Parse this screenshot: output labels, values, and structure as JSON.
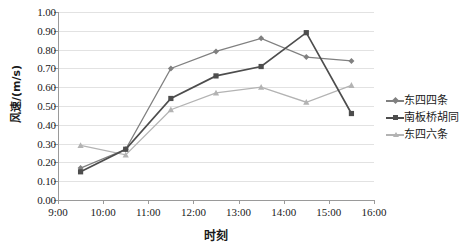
{
  "chart_data": {
    "type": "line",
    "title": "",
    "xlabel": "时刻",
    "ylabel": "风速/(m/s)",
    "ylim": [
      0.0,
      1.0
    ],
    "ytick_labels": [
      "0.00",
      "0.10",
      "0.20",
      "0.30",
      "0.40",
      "0.50",
      "0.60",
      "0.70",
      "0.80",
      "0.90",
      "1.00"
    ],
    "ytick_values": [
      0.0,
      0.1,
      0.2,
      0.3,
      0.4,
      0.5,
      0.6,
      0.7,
      0.8,
      0.9,
      1.0
    ],
    "xtick_labels": [
      "9:00",
      "10:00",
      "11:00",
      "12:00",
      "13:00",
      "14:00",
      "15:00",
      "16:00"
    ],
    "xtick_values": [
      9,
      10,
      11,
      12,
      13,
      14,
      15,
      16
    ],
    "xlim": [
      9,
      16
    ],
    "grid": "horizontal",
    "legend_position": "right",
    "x": [
      9.5,
      10.5,
      11.5,
      12.5,
      13.5,
      14.5,
      15.5
    ],
    "series": [
      {
        "name": "东四四条",
        "color": "#808080",
        "marker": "diamond",
        "values": [
          0.17,
          0.27,
          0.7,
          0.79,
          0.86,
          0.76,
          0.74
        ]
      },
      {
        "name": "南板桥胡同",
        "color": "#4d4d4d",
        "marker": "square",
        "values": [
          0.15,
          0.27,
          0.54,
          0.66,
          0.71,
          0.89,
          0.46
        ]
      },
      {
        "name": "东四六条",
        "color": "#b3b3b3",
        "marker": "triangle",
        "values": [
          0.29,
          0.24,
          0.48,
          0.57,
          0.6,
          0.52,
          0.61
        ]
      }
    ]
  },
  "colors": {
    "axis": "#9a9a9a",
    "grid": "#e2e2e2",
    "background": "#ffffff",
    "text": "#1a1a1a"
  }
}
